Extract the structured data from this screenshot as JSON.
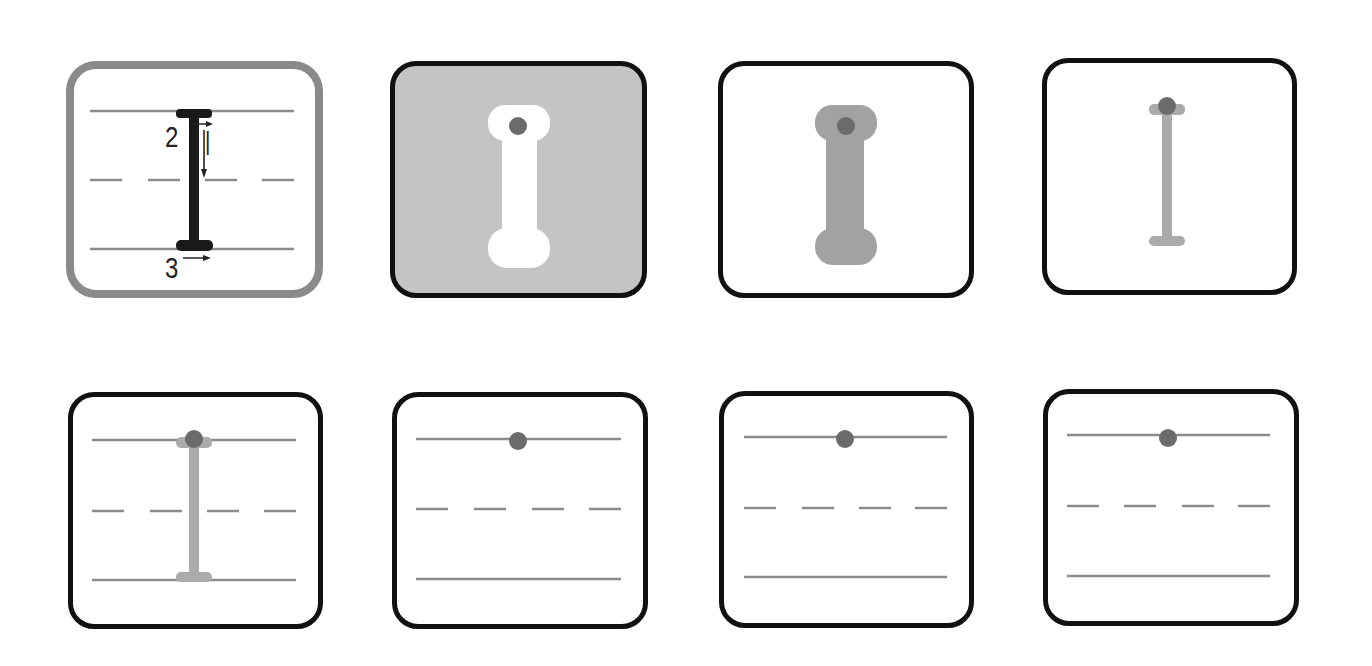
{
  "worksheet": {
    "letter": "I",
    "colors": {
      "guide_line": "#8c8c8c",
      "stroke_dark": "#1a1a1a",
      "stroke_light": "#aaaaaa",
      "stroke_medium": "#9c9c9c",
      "start_dot": "#6b6b6b",
      "card_border": "#111111",
      "highlight_border": "#8a8a8a",
      "filled_bg": "#c4c4c4"
    },
    "cards": [
      {
        "id": "stroke-order-demo",
        "row": 1,
        "style": "highlight",
        "stroke_labels": [
          "|",
          "2",
          "3"
        ],
        "guides": true
      },
      {
        "id": "glyph-reverse",
        "row": 1,
        "style": "filled",
        "guides": false,
        "start_dot": true
      },
      {
        "id": "glyph-bold-trace",
        "row": 1,
        "style": "plain",
        "guides": false,
        "start_dot": true
      },
      {
        "id": "glyph-thin-trace",
        "row": 1,
        "style": "plain",
        "guides": false,
        "start_dot": true
      },
      {
        "id": "glyph-trace-on-lines",
        "row": 2,
        "style": "plain",
        "guides": true,
        "start_dot": true
      },
      {
        "id": "practice-1",
        "row": 2,
        "style": "plain",
        "guides": true,
        "start_dot": true
      },
      {
        "id": "practice-2",
        "row": 2,
        "style": "plain",
        "guides": true,
        "start_dot": true
      },
      {
        "id": "practice-3",
        "row": 2,
        "style": "plain",
        "guides": true,
        "start_dot": true
      }
    ]
  }
}
